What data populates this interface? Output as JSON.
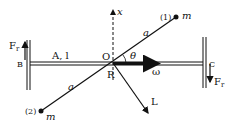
{
  "diagram": {
    "labels": {
      "x_axis": "x",
      "mass1_index": "(1)",
      "mass1_m": "m",
      "mass2_index": "(2)",
      "mass2_m": "m",
      "rod_a_upper": "a",
      "rod_a_lower": "a",
      "theta": "θ",
      "omega": "ω",
      "angular_momentum": "L",
      "origin": "O",
      "rotation_point": "R",
      "shaft": "A, l",
      "bearing_left": "B",
      "bearing_right": "C",
      "force_left_main": "F",
      "force_left_sub": "r",
      "force_right_main": "F",
      "force_right_sub": "r"
    },
    "colors": {
      "ink": "#111111",
      "background": "#ffffff"
    }
  }
}
